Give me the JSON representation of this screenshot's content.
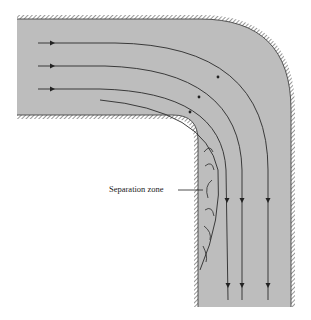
{
  "figure": {
    "annotation": "Separation zone",
    "colors": {
      "fluid": "#bdbdbd",
      "wall": "#333333",
      "streamline": "#2a2a2a",
      "background": "#ffffff"
    },
    "streamline_count": 4,
    "eddy_count": 6
  }
}
